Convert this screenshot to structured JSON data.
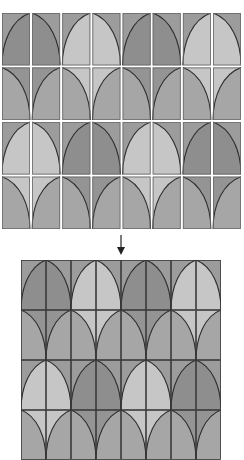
{
  "diagram": {
    "type": "tile-assembly",
    "colors": {
      "background": "#ffffff",
      "line": "#2e2e2e",
      "outer": "#9c9c9c",
      "dark_fill": "#8e8e8e",
      "light_fill": "#c6c6c6",
      "medium_fill": "#a6a6a6",
      "tile_border": "#6a6a6a",
      "separator": "#ffffff"
    },
    "grid": {
      "columns": 8,
      "rows": 4
    },
    "tile_legend": {
      "L": "arch left half (arc from top-right corner to bottom-left)",
      "R": "arch right half (arc from top-left corner to bottom-right)",
      "SL": "spandrel left (arc from top-left corner to bottom-right, corner filled)",
      "SR": "spandrel right (arc from top-right corner to bottom-left, corner filled)"
    },
    "rows": [
      [
        {
          "shape": "L",
          "tone": "dark"
        },
        {
          "shape": "R",
          "tone": "dark"
        },
        {
          "shape": "L",
          "tone": "light"
        },
        {
          "shape": "R",
          "tone": "light"
        },
        {
          "shape": "L",
          "tone": "dark"
        },
        {
          "shape": "R",
          "tone": "dark"
        },
        {
          "shape": "L",
          "tone": "light"
        },
        {
          "shape": "R",
          "tone": "light"
        }
      ],
      [
        {
          "shape": "SL",
          "tone": "dark"
        },
        {
          "shape": "SR",
          "tone": "dark"
        },
        {
          "shape": "SL",
          "tone": "light"
        },
        {
          "shape": "SR",
          "tone": "light"
        },
        {
          "shape": "SL",
          "tone": "dark"
        },
        {
          "shape": "SR",
          "tone": "dark"
        },
        {
          "shape": "SL",
          "tone": "light"
        },
        {
          "shape": "SR",
          "tone": "light"
        }
      ],
      [
        {
          "shape": "L",
          "tone": "light"
        },
        {
          "shape": "R",
          "tone": "light"
        },
        {
          "shape": "L",
          "tone": "dark"
        },
        {
          "shape": "R",
          "tone": "dark"
        },
        {
          "shape": "L",
          "tone": "light"
        },
        {
          "shape": "R",
          "tone": "light"
        },
        {
          "shape": "L",
          "tone": "dark"
        },
        {
          "shape": "R",
          "tone": "dark"
        }
      ],
      [
        {
          "shape": "SL",
          "tone": "light"
        },
        {
          "shape": "SR",
          "tone": "light"
        },
        {
          "shape": "SL",
          "tone": "dark"
        },
        {
          "shape": "SR",
          "tone": "dark"
        },
        {
          "shape": "SL",
          "tone": "light"
        },
        {
          "shape": "SR",
          "tone": "light"
        },
        {
          "shape": "SL",
          "tone": "dark"
        },
        {
          "shape": "SR",
          "tone": "dark"
        }
      ]
    ],
    "top_panel": {
      "label": "separated tiles",
      "tile_w": 28,
      "tile_h": 52,
      "gap": 2.2
    },
    "bottom_panel": {
      "label": "assembled pattern",
      "tile_w": 25,
      "tile_h": 50,
      "gap": 0
    },
    "arrow": {
      "direction": "down"
    }
  }
}
